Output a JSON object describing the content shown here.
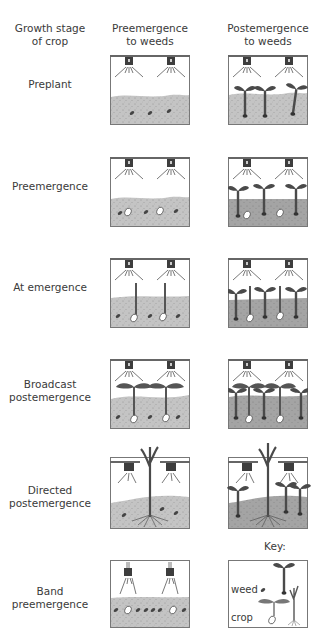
{
  "headers": {
    "col0": [
      "Growth stage",
      "of crop"
    ],
    "col1": [
      "Preemergence",
      "to weeds"
    ],
    "col2": [
      "Postemergence",
      "to weeds"
    ]
  },
  "rows": [
    {
      "label": [
        "Preplant"
      ]
    },
    {
      "label": [
        "Preemergence"
      ]
    },
    {
      "label": [
        "At emergence"
      ]
    },
    {
      "label": [
        "Broadcast",
        "postemergence"
      ]
    },
    {
      "label": [
        "Directed",
        "postemergence"
      ]
    },
    {
      "label": [
        "Band",
        "preemergence"
      ]
    }
  ],
  "key": {
    "title": "Key:",
    "weed_label": "weed",
    "crop_label": "crop"
  },
  "colors": {
    "soil": "#b8b8b8",
    "soil_dark": "#8f8f8f",
    "outline": "#555555",
    "plant": "#4a4a4a"
  }
}
